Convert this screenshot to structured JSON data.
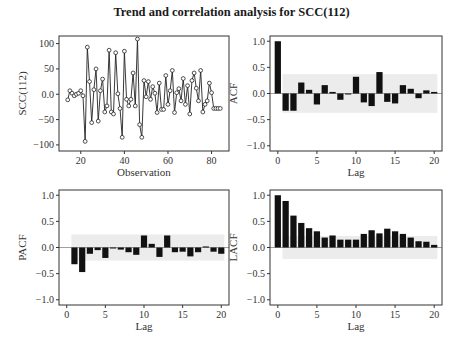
{
  "figure": {
    "title": "Trend and correlation analysis for SCC(112)"
  },
  "colors": {
    "bar": "#111111",
    "band": "#ececec",
    "frame": "#333333",
    "zero_line": "#888888",
    "line": "#222222"
  },
  "chart_data": [
    {
      "id": "series",
      "type": "line",
      "title": "",
      "xlabel": "Observation",
      "ylabel": "SCC(112)",
      "xlim": [
        10,
        88
      ],
      "ylim": [
        -112,
        115
      ],
      "xticks": [
        20,
        40,
        60,
        80
      ],
      "yticks": [
        -100,
        -50,
        0,
        50,
        100
      ],
      "grid": false,
      "markers": "open-circle",
      "x": [
        14,
        15,
        16,
        17,
        18,
        19,
        20,
        21,
        22,
        23,
        24,
        25,
        26,
        27,
        28,
        29,
        30,
        31,
        32,
        33,
        34,
        35,
        36,
        37,
        38,
        39,
        40,
        41,
        42,
        43,
        44,
        45,
        46,
        47,
        48,
        49,
        50,
        51,
        52,
        53,
        54,
        55,
        56,
        57,
        58,
        59,
        60,
        61,
        62,
        63,
        64,
        65,
        66,
        67,
        68,
        69,
        70,
        71,
        72,
        73,
        74,
        75,
        76,
        77,
        78,
        79,
        80,
        81,
        82,
        83,
        84
      ],
      "y": [
        -11,
        7,
        2,
        -3,
        0,
        2,
        7,
        -3,
        -93,
        93,
        25,
        -56,
        9,
        50,
        -53,
        7,
        30,
        -35,
        -23,
        87,
        -35,
        -39,
        82,
        1,
        -28,
        -85,
        85,
        -10,
        -23,
        -10,
        42,
        -23,
        109,
        -60,
        -85,
        27,
        -5,
        25,
        -10,
        15,
        2,
        -36,
        22,
        -30,
        -30,
        37,
        -20,
        7,
        47,
        -36,
        3,
        11,
        -13,
        31,
        -20,
        17,
        -39,
        27,
        42,
        12,
        -13,
        47,
        -35,
        -20,
        -13,
        22,
        3,
        -28,
        -28,
        -28,
        -28
      ]
    },
    {
      "id": "acf",
      "type": "bar",
      "title": "",
      "xlabel": "Lag",
      "ylabel": "ACF",
      "xlim": [
        -1,
        21
      ],
      "ylim": [
        -1.1,
        1.1
      ],
      "xticks": [
        0,
        5,
        10,
        15,
        20
      ],
      "yticks": [
        -1.0,
        -0.5,
        0.0,
        0.5,
        1.0
      ],
      "confidence_band": 0.37,
      "categories": [
        0,
        1,
        2,
        3,
        4,
        5,
        6,
        7,
        8,
        9,
        10,
        11,
        12,
        13,
        14,
        15,
        16,
        17,
        18,
        19,
        20
      ],
      "values": [
        1.0,
        -0.33,
        -0.33,
        0.21,
        0.07,
        -0.21,
        0.16,
        0.03,
        -0.12,
        0.0,
        0.32,
        -0.17,
        -0.24,
        0.41,
        -0.16,
        -0.19,
        0.16,
        0.09,
        -0.09,
        0.06,
        0.03
      ]
    },
    {
      "id": "pacf",
      "type": "bar",
      "title": "",
      "xlabel": "Lag",
      "ylabel": "PACF",
      "xlim": [
        -1,
        21
      ],
      "ylim": [
        -1.1,
        1.1
      ],
      "xticks": [
        0,
        5,
        10,
        15,
        20
      ],
      "yticks": [
        -1.0,
        -0.5,
        0.0,
        0.5,
        1.0
      ],
      "confidence_band": 0.25,
      "categories": [
        1,
        2,
        3,
        4,
        5,
        6,
        7,
        8,
        9,
        10,
        11,
        12,
        13,
        14,
        15,
        16,
        17,
        18,
        19,
        20
      ],
      "values": [
        -0.32,
        -0.47,
        -0.12,
        -0.05,
        -0.2,
        -0.01,
        -0.04,
        -0.09,
        -0.14,
        0.23,
        0.07,
        -0.18,
        0.23,
        -0.09,
        -0.08,
        -0.17,
        -0.09,
        0.02,
        -0.08,
        -0.12
      ]
    },
    {
      "id": "lacf",
      "type": "bar",
      "title": "",
      "xlabel": "Lag",
      "ylabel": "LACF",
      "xlim": [
        -1,
        21
      ],
      "ylim": [
        -1.1,
        1.1
      ],
      "xticks": [
        0,
        5,
        10,
        15,
        20
      ],
      "yticks": [
        -1.0,
        -0.5,
        0.0,
        0.5,
        1.0
      ],
      "confidence_band": 0.22,
      "categories": [
        0,
        1,
        2,
        3,
        4,
        5,
        6,
        7,
        8,
        9,
        10,
        11,
        12,
        13,
        14,
        15,
        16,
        17,
        18,
        19,
        20
      ],
      "values": [
        1.0,
        0.89,
        0.61,
        0.47,
        0.37,
        0.31,
        0.19,
        0.23,
        0.15,
        0.15,
        0.15,
        0.26,
        0.33,
        0.27,
        0.36,
        0.31,
        0.26,
        0.19,
        0.12,
        0.11,
        0.05
      ]
    }
  ]
}
